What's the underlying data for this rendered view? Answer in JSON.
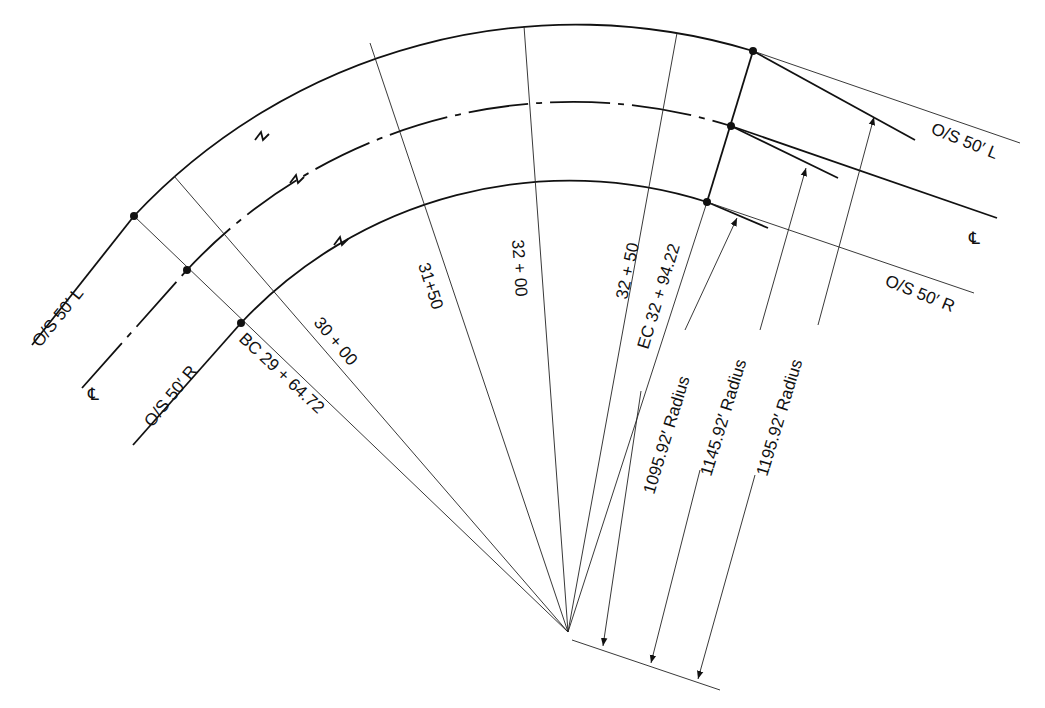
{
  "diagram": {
    "labels": {
      "os_left_start": "O/S 50′ L",
      "cl_start": "℄",
      "os_right_start": "O/S 50′ R",
      "bc": "BC  29 + 64.72",
      "sta_3000": "30 + 00",
      "sta_3150": "31+50",
      "sta_3200": "32 + 00",
      "sta_3250": "32 + 50",
      "ec": "EC 32 + 94.22",
      "radius_inner": "1095.92′ Radius",
      "radius_cl": "1145.92′ Radius",
      "radius_outer": "1195.92′ Radius",
      "os_left_end": "O/S 50′ L",
      "cl_end": "℄",
      "os_right_end": "O/S 50′ R"
    },
    "curves": [
      {
        "name": "O/S 50' L",
        "offset": "50' L",
        "radius_ft": 1195.92
      },
      {
        "name": "Centerline",
        "offset": "0",
        "radius_ft": 1145.92
      },
      {
        "name": "O/S 50' R",
        "offset": "50' R",
        "radius_ft": 1095.92
      }
    ],
    "stations": [
      "BC 29+64.72",
      "30+00",
      "31+50",
      "32+00",
      "32+50",
      "EC 32+94.22"
    ],
    "colors": {
      "line": "#111111",
      "background": "#ffffff"
    }
  }
}
